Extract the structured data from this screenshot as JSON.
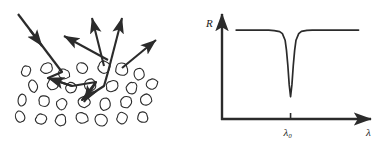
{
  "figure": {
    "ink_color": "#2b2b2b",
    "background_color": "#ffffff",
    "panel_count": 2
  },
  "left_panel": {
    "name": "scattering-diagram",
    "description": "Incident ray entering a medium of irregular particles, multiple scattering path inside, and several scattered rays emerging upward",
    "incident_arrow": {
      "label": "incident-ray",
      "x1": 18,
      "y1": 14,
      "x2": 62,
      "y2": 72
    },
    "scattered_arrows": [
      {
        "label": "scattered-ray-1",
        "x1": 108,
        "y1": 60,
        "x2": 64,
        "y2": 36
      },
      {
        "label": "scattered-ray-2",
        "x1": 104,
        "y1": 66,
        "x2": 92,
        "y2": 18
      },
      {
        "label": "scattered-ray-3",
        "x1": 108,
        "y1": 72,
        "x2": 122,
        "y2": 18
      },
      {
        "label": "scattered-ray-4",
        "x1": 122,
        "y1": 68,
        "x2": 156,
        "y2": 40
      }
    ],
    "internal_path": {
      "label": "multiple-scattering-path",
      "points": "62,72 48,78 72,86 96,82 82,100 104,86 108,72"
    },
    "particles": [
      {
        "cx": 26,
        "cy": 71,
        "rx": 4.6,
        "ry": 5.4,
        "rot": 12
      },
      {
        "cx": 47,
        "cy": 68,
        "rx": 6.0,
        "ry": 5.2,
        "rot": -18
      },
      {
        "cx": 64,
        "cy": 74,
        "rx": 5.4,
        "ry": 5.0,
        "rot": 25
      },
      {
        "cx": 82,
        "cy": 68,
        "rx": 5.6,
        "ry": 5.4,
        "rot": -8
      },
      {
        "cx": 104,
        "cy": 67,
        "rx": 6.2,
        "ry": 6.0,
        "rot": 15
      },
      {
        "cx": 122,
        "cy": 69,
        "rx": 6.0,
        "ry": 6.4,
        "rot": -22
      },
      {
        "cx": 139,
        "cy": 74,
        "rx": 5.0,
        "ry": 5.6,
        "rot": 10
      },
      {
        "cx": 33,
        "cy": 86,
        "rx": 4.4,
        "ry": 6.0,
        "rot": -14
      },
      {
        "cx": 53,
        "cy": 84,
        "rx": 5.8,
        "ry": 5.6,
        "rot": 20
      },
      {
        "cx": 71,
        "cy": 88,
        "rx": 5.0,
        "ry": 5.2,
        "rot": -10
      },
      {
        "cx": 90,
        "cy": 85,
        "rx": 5.6,
        "ry": 5.8,
        "rot": 18
      },
      {
        "cx": 112,
        "cy": 86,
        "rx": 6.4,
        "ry": 5.4,
        "rot": -16
      },
      {
        "cx": 132,
        "cy": 88,
        "rx": 5.2,
        "ry": 6.0,
        "rot": 8
      },
      {
        "cx": 152,
        "cy": 84,
        "rx": 5.4,
        "ry": 5.2,
        "rot": -20
      },
      {
        "cx": 22,
        "cy": 100,
        "rx": 4.2,
        "ry": 5.8,
        "rot": 16
      },
      {
        "cx": 44,
        "cy": 101,
        "rx": 5.6,
        "ry": 5.4,
        "rot": -12
      },
      {
        "cx": 62,
        "cy": 104,
        "rx": 5.0,
        "ry": 5.6,
        "rot": 22
      },
      {
        "cx": 84,
        "cy": 102,
        "rx": 5.8,
        "ry": 5.2,
        "rot": -6
      },
      {
        "cx": 105,
        "cy": 104,
        "rx": 5.4,
        "ry": 6.0,
        "rot": 14
      },
      {
        "cx": 126,
        "cy": 102,
        "rx": 6.0,
        "ry": 5.4,
        "rot": -18
      },
      {
        "cx": 146,
        "cy": 100,
        "rx": 5.2,
        "ry": 5.6,
        "rot": 10
      },
      {
        "cx": 20,
        "cy": 117,
        "rx": 4.4,
        "ry": 5.6,
        "rot": -16
      },
      {
        "cx": 41,
        "cy": 119,
        "rx": 5.6,
        "ry": 5.2,
        "rot": 18
      },
      {
        "cx": 61,
        "cy": 120,
        "rx": 5.2,
        "ry": 5.8,
        "rot": -8
      },
      {
        "cx": 82,
        "cy": 118,
        "rx": 5.8,
        "ry": 5.4,
        "rot": 24
      },
      {
        "cx": 101,
        "cy": 120,
        "rx": 6.2,
        "ry": 6.0,
        "rot": -14
      },
      {
        "cx": 122,
        "cy": 118,
        "rx": 5.4,
        "ry": 5.6,
        "rot": 12
      },
      {
        "cx": 143,
        "cy": 117,
        "rx": 5.0,
        "ry": 5.4,
        "rot": -20
      }
    ]
  },
  "chart_data": {
    "type": "line",
    "name": "reflectance-spectrum",
    "title": "",
    "xlabel": "λ",
    "ylabel": "R",
    "x_tick_labels": [
      "λ₀"
    ],
    "y_tick_labels": [],
    "grid": false,
    "legend": null,
    "annotations": [
      {
        "text": "λ₀",
        "meaning": "resonance wavelength at reflectance minimum"
      },
      {
        "text": "R",
        "meaning": "reflectance, vertical axis"
      },
      {
        "text": "λ",
        "meaning": "wavelength, horizontal axis"
      }
    ],
    "axis_style": "arrow-terminated",
    "xlim": [
      0,
      1
    ],
    "ylim": [
      0,
      1
    ],
    "baseline_level": 0.88,
    "dip_center": 0.46,
    "dip_min_level": 0.22,
    "dip_half_width": 0.035,
    "x": [
      0.06,
      0.12,
      0.18,
      0.24,
      0.3,
      0.34,
      0.38,
      0.4,
      0.42,
      0.43,
      0.44,
      0.45,
      0.46,
      0.47,
      0.48,
      0.49,
      0.5,
      0.52,
      0.54,
      0.58,
      0.62,
      0.68,
      0.74,
      0.82,
      0.9,
      0.96
    ],
    "values": [
      0.88,
      0.88,
      0.88,
      0.88,
      0.88,
      0.875,
      0.865,
      0.845,
      0.78,
      0.68,
      0.53,
      0.34,
      0.22,
      0.34,
      0.53,
      0.68,
      0.78,
      0.845,
      0.868,
      0.878,
      0.88,
      0.88,
      0.88,
      0.88,
      0.88,
      0.88
    ]
  }
}
